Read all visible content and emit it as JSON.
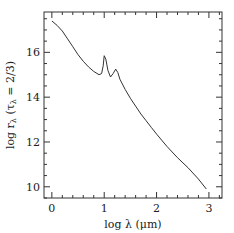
{
  "chart_data": {
    "type": "line",
    "title": "",
    "xlabel": "log λ (μm)",
    "ylabel": "log r_λ (τ_λ = 2/3)",
    "xlim": [
      -0.15,
      3.25
    ],
    "ylim": [
      9.5,
      17.8
    ],
    "xticks": [
      0,
      1,
      2,
      3
    ],
    "xtick_labels": [
      "0",
      "1",
      "2",
      "3"
    ],
    "yticks": [
      10,
      12,
      14,
      16
    ],
    "ytick_labels": [
      "10",
      "12",
      "14",
      "16"
    ],
    "x_minor_step": 0.2,
    "y_minor_step": 0.5,
    "grid": false,
    "series": [
      {
        "name": "log r_lambda",
        "x": [
          0.0,
          0.1,
          0.2,
          0.3,
          0.4,
          0.5,
          0.6,
          0.7,
          0.8,
          0.9,
          0.95,
          0.98,
          1.0,
          1.03,
          1.07,
          1.12,
          1.17,
          1.22,
          1.26,
          1.3,
          1.4,
          1.5,
          1.6,
          1.7,
          1.8,
          1.9,
          2.0,
          2.2,
          2.4,
          2.6,
          2.8,
          2.95
        ],
        "y": [
          17.4,
          17.2,
          16.95,
          16.6,
          16.25,
          15.9,
          15.6,
          15.35,
          15.15,
          15.0,
          15.05,
          15.4,
          15.85,
          15.7,
          15.2,
          14.9,
          15.05,
          15.25,
          15.1,
          14.8,
          14.35,
          13.95,
          13.6,
          13.25,
          12.95,
          12.65,
          12.35,
          11.8,
          11.3,
          10.85,
          10.35,
          9.9
        ]
      }
    ]
  }
}
